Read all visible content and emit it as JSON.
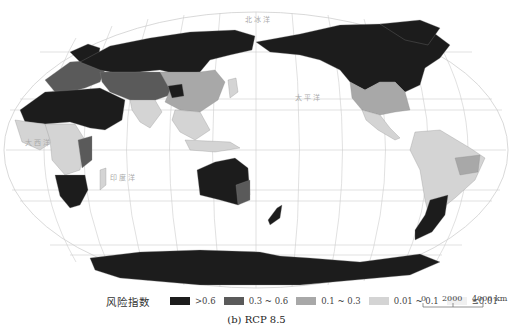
{
  "figure": {
    "caption": "(b) RCP 8.5",
    "projection": "Pacific-centered world map (Robinson-like)"
  },
  "legend": {
    "title": "风险指数",
    "items": [
      {
        "label": ">0.6",
        "color": "#1c1c1c"
      },
      {
        "label": "0.3 ~ 0.6",
        "color": "#5a5a5a"
      },
      {
        "label": "0.1 ~ 0.3",
        "color": "#a8a8a8"
      },
      {
        "label": "0.01 ~ 0.1",
        "color": "#d4d4d4"
      },
      {
        "label": "≤0.01",
        "color": "#f0f0f0"
      }
    ]
  },
  "scale_bar": {
    "ticks": [
      "0",
      "2000",
      "4000 km"
    ]
  },
  "ocean_labels": {
    "pacific_north": "太 平 洋",
    "indian": "印 度 洋",
    "atlantic": "大 西 洋",
    "arctic": "北 冰 洋"
  },
  "regions": {
    "russia_north_asia": ">0.6",
    "canada_alaska": ">0.6",
    "north_africa_middle_east": ">0.6",
    "southern_africa": ">0.6",
    "australia_main": ">0.6",
    "australia_southeast": "0.3 ~ 0.6",
    "new_zealand": ">0.6",
    "patagonia": ">0.6",
    "antarctica": ">0.6",
    "central_asia": "0.3 ~ 0.6",
    "europe": "0.3 ~ 0.6",
    "east_africa": "0.3 ~ 0.6",
    "usa": "0.1 ~ 0.3",
    "china_east": "0.1 ~ 0.3",
    "south_america": "0.01 ~ 0.1",
    "south_asia": "0.01 ~ 0.1",
    "southeast_asia": "0.01 ~ 0.1"
  }
}
